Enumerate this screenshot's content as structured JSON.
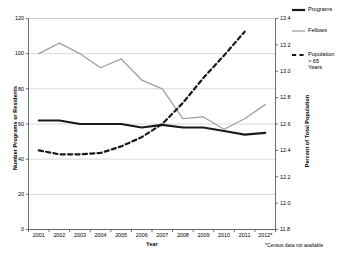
{
  "chart_data": {
    "type": "line",
    "title": "",
    "xlabel": "Year",
    "ylabel": "Number Programs or Residents",
    "ylabel_secondary": "Percent of Total Population",
    "categories": [
      "2001",
      "2002",
      "2003",
      "2004",
      "2005",
      "2006",
      "2007",
      "2008",
      "2009",
      "2010",
      "2011",
      "2012*"
    ],
    "ylim": [
      0,
      120
    ],
    "yticks": [
      "0",
      "20",
      "40",
      "60",
      "80",
      "100",
      "120"
    ],
    "ylim_secondary": [
      11.8,
      13.4
    ],
    "yticks_secondary": [
      "11.8",
      "12.0",
      "12.2",
      "12.4",
      "12.6",
      "12.8",
      "13.0",
      "13.2",
      "13.4"
    ],
    "grid": true,
    "legend_position": "right",
    "series": [
      {
        "name": "Programs",
        "axis": "left",
        "style": "solid",
        "color": "#1a1a1a",
        "width": 2.2,
        "values": [
          62,
          62,
          60,
          60,
          60,
          58,
          59.5,
          58,
          58,
          56,
          54,
          55
        ]
      },
      {
        "name": "Fellows",
        "axis": "left",
        "style": "solid",
        "color": "#a0a0a0",
        "width": 1.3,
        "values": [
          100,
          106,
          100,
          92,
          97,
          85,
          80,
          63,
          64,
          57,
          63,
          71
        ]
      },
      {
        "name": "Population > 65 Years",
        "axis": "right",
        "style": "dashed",
        "color": "#1a1a1a",
        "width": 2.2,
        "values": [
          12.4,
          12.37,
          12.37,
          12.38,
          12.43,
          12.5,
          12.6,
          12.76,
          12.95,
          13.12,
          13.3,
          null
        ]
      }
    ]
  },
  "legend": {
    "items": [
      {
        "label": "Programs",
        "style": "solid-black"
      },
      {
        "label": "Fellows",
        "style": "solid-gray"
      },
      {
        "label": "Population\n> 65\nYears",
        "style": "dashed-black"
      }
    ]
  },
  "footnote": "*Census data not available"
}
